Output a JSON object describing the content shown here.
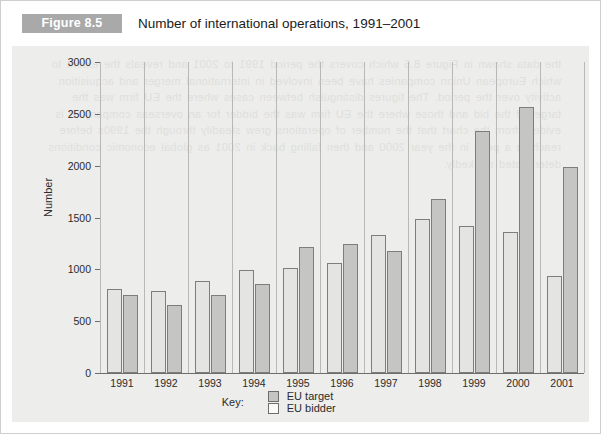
{
  "header": {
    "figure_tag": "Figure 8.5",
    "title": "Number of international operations, 1991–2001"
  },
  "legend": {
    "key_label": "Key:",
    "entries": [
      {
        "label": "EU target",
        "swatch": "filled-gray-swatch",
        "color": "#c5c5c3"
      },
      {
        "label": "EU bidder",
        "swatch": "outlined-white-swatch",
        "color": "#fafafa"
      }
    ]
  },
  "ghost_text": "the data shown in Figure 8.5 which covers the period 1991 to 2001 and reveals the extent to which European Union companies have been involved in international merger and acquisition activity over the period. The figures distinguish between cases where the EU firm was the target of the bid and those where the EU firm was the bidder for an overseas company. It is evident from the chart that the number of operations grew steadily through the 1990s before reaching a peak in the year 2000 and then falling back in 2001 as global economic conditions deteriorated markedly.",
  "chart_data": {
    "type": "bar",
    "title": "Number of international operations, 1991–2001",
    "xlabel": "",
    "ylabel": "Number",
    "ylim": [
      0,
      3000
    ],
    "y_ticks": [
      0,
      500,
      1000,
      1500,
      2000,
      2500,
      3000
    ],
    "y_tick_labels": [
      "0",
      "500",
      "1000",
      "1500",
      "2000",
      "2500",
      "3000"
    ],
    "grid": false,
    "legend_position": "bottom-center",
    "categories": [
      "1991",
      "1992",
      "1993",
      "1994",
      "1995",
      "1996",
      "1997",
      "1998",
      "1999",
      "2000",
      "2001"
    ],
    "series": [
      {
        "name": "EU target",
        "color": "#e4e4e2",
        "values": [
          810,
          790,
          890,
          990,
          1015,
          1060,
          1330,
          1490,
          1415,
          1360,
          935
        ]
      },
      {
        "name": "EU bidder",
        "color": "#c5c5c3",
        "values": [
          750,
          655,
          755,
          855,
          1220,
          1245,
          1180,
          1680,
          2330,
          2570,
          1990
        ]
      }
    ]
  }
}
